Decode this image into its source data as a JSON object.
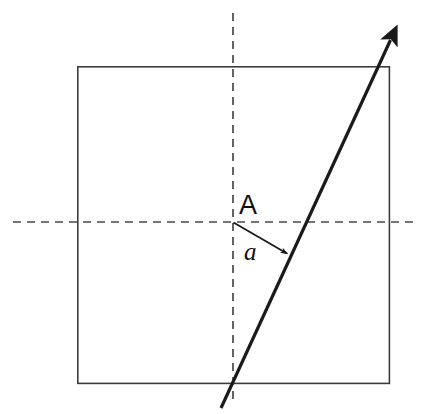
{
  "figure": {
    "width": 427,
    "height": 414,
    "background_color": "#ffffff"
  },
  "labels": {
    "point_a": "A",
    "angle_a": "a"
  },
  "colors": {
    "stroke": "#1a1a1a",
    "square_stroke": "#3c3c3c",
    "dashed_stroke": "#4a4a4a",
    "background": "#ffffff"
  },
  "geometry": {
    "square": {
      "x": 77,
      "y": 66,
      "width": 313,
      "height": 318,
      "stroke_width": 1.6
    },
    "origin": {
      "name": "A",
      "x": 233,
      "y": 222
    },
    "vertical_axis": {
      "x": 233,
      "y_start": 13,
      "y_end": 405,
      "dash": "8 6",
      "stroke_width": 1.6
    },
    "horizontal_axis": {
      "y": 222,
      "x_start": 13,
      "x_end": 416,
      "dash": "8 6",
      "stroke_width": 1.6
    },
    "ray": {
      "x_start": 221,
      "y_start": 408,
      "x_end": 392,
      "y_end": 37,
      "arrow_tip_x": 394,
      "arrow_tip_y": 32,
      "stroke_width": 3.2
    },
    "angle_arrow": {
      "x_start": 233,
      "y_start": 222,
      "x_end": 292,
      "y_end": 256,
      "stroke_width": 1.8
    }
  }
}
